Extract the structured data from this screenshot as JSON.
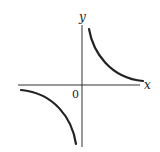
{
  "diagram": {
    "title": "",
    "axes": {
      "x_label": "x",
      "y_label": "y",
      "origin_label": "0"
    },
    "curves": [
      {
        "name": "branch-quadrant-1",
        "quadrant": "I"
      },
      {
        "name": "branch-quadrant-3",
        "quadrant": "III"
      }
    ],
    "colors": {
      "axis": "#333333",
      "curve": "#222222",
      "background": "#ffffff"
    }
  }
}
